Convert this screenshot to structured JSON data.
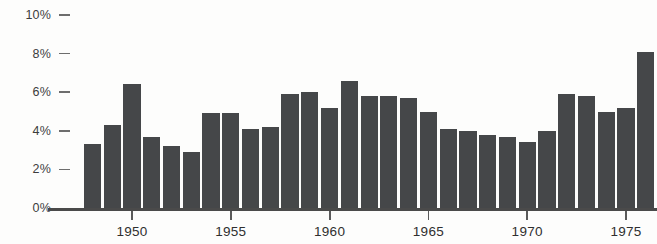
{
  "chart_data": {
    "type": "bar",
    "title": "",
    "xlabel": "",
    "ylabel": "",
    "ylim": [
      0,
      10
    ],
    "grid": false,
    "legend": null,
    "y_ticks": [
      {
        "value": 10,
        "label": "10%"
      },
      {
        "value": 8,
        "label": "8%"
      },
      {
        "value": 6,
        "label": "6%"
      },
      {
        "value": 4,
        "label": "4%"
      },
      {
        "value": 2,
        "label": "2%"
      },
      {
        "value": 0,
        "label": "0%"
      }
    ],
    "x_ticks": [
      {
        "value": 1950,
        "label": "1950"
      },
      {
        "value": 1955,
        "label": "1955"
      },
      {
        "value": 1960,
        "label": "1960"
      },
      {
        "value": 1965,
        "label": "1965"
      },
      {
        "value": 1970,
        "label": "1970"
      },
      {
        "value": 1975,
        "label": "1975"
      }
    ],
    "categories": [
      1948,
      1949,
      1950,
      1951,
      1952,
      1953,
      1954,
      1955,
      1956,
      1957,
      1958,
      1959,
      1960,
      1961,
      1962,
      1963,
      1964,
      1965,
      1966,
      1967,
      1968,
      1969,
      1970,
      1971,
      1972,
      1973,
      1974,
      1975,
      1976
    ],
    "values": [
      3.3,
      4.3,
      6.4,
      3.7,
      3.2,
      2.9,
      4.9,
      4.9,
      4.1,
      4.2,
      5.9,
      6.0,
      5.2,
      6.6,
      5.8,
      5.8,
      5.7,
      5.0,
      4.1,
      4.0,
      3.8,
      3.7,
      3.4,
      4.0,
      5.9,
      5.8,
      5.0,
      5.2,
      8.1
    ],
    "value_unit": "%",
    "bar_color": "#454749",
    "axis_color": "#4a4a4a",
    "background_color": "#fdfdfc"
  }
}
